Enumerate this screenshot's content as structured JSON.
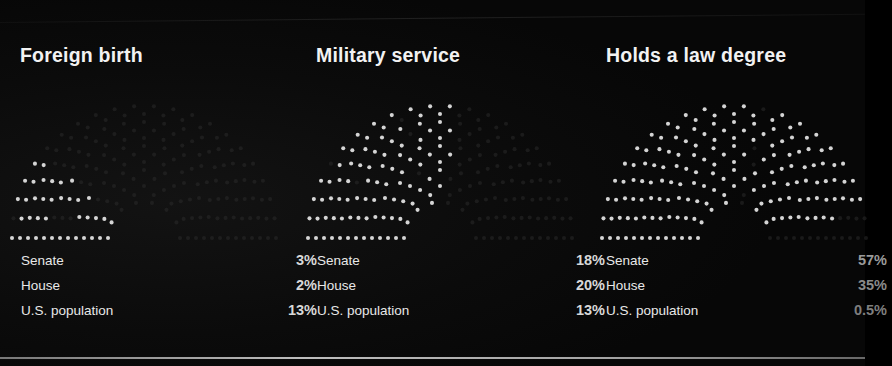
{
  "page": {
    "background_color": "#080808",
    "text_color": "#f2f2f2",
    "divider_color": "#e6e6e6"
  },
  "columns": [
    {
      "id": "foreign-birth",
      "title": "Foreign birth",
      "rows": [
        {
          "label": "Senate",
          "value": "3%",
          "pct": 3
        },
        {
          "label": "House",
          "value": "2%",
          "pct": 2
        },
        {
          "label": "U.S. population",
          "value": "13%",
          "pct": 13
        }
      ]
    },
    {
      "id": "military-service",
      "title": "Military service",
      "rows": [
        {
          "label": "Senate",
          "value": "18%",
          "pct": 18
        },
        {
          "label": "House",
          "value": "20%",
          "pct": 20
        },
        {
          "label": "U.S. population",
          "value": "13%",
          "pct": 13
        }
      ]
    },
    {
      "id": "law-degree",
      "title": "Holds a law degree",
      "rows": [
        {
          "label": "Senate",
          "value": "57%",
          "pct": 57
        },
        {
          "label": "House",
          "value": "35%",
          "pct": 35
        },
        {
          "label": "U.S.  population",
          "value": "0.5%",
          "pct": 0.5
        }
      ]
    }
  ],
  "chart_data": {
    "type": "bar",
    "title": "",
    "subtitle": "",
    "chart_style": "dot-grid hemicycle (legislative seating) with highlighted wedge proportional to percentage",
    "categories": [
      "Senate",
      "House",
      "U.S. population"
    ],
    "series": [
      {
        "name": "Foreign birth",
        "values": [
          3,
          2,
          13
        ],
        "labels": [
          "3%",
          "2%",
          "13%"
        ]
      },
      {
        "name": "Military service",
        "values": [
          18,
          20,
          13
        ],
        "labels": [
          "18%",
          "20%",
          "13%"
        ]
      },
      {
        "name": "Holds a law degree",
        "values": [
          57,
          35,
          0.5
        ],
        "labels": [
          "57%",
          "35%",
          "0.5%"
        ]
      }
    ],
    "xlabel": "",
    "ylabel": "Percent",
    "ylim": [
      0,
      100
    ],
    "grid": false,
    "legend": "none",
    "units": "%"
  }
}
